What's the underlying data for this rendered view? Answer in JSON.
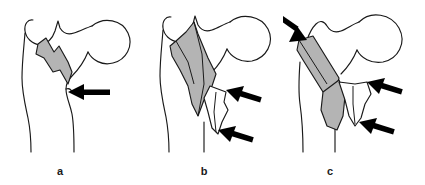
{
  "figure": {
    "background_color": "#ffffff",
    "outline_color": "#1a1a1a",
    "fragment_fill_color": "#b4b4b4",
    "arrow_color": "#000000",
    "width": 425,
    "height": 185
  },
  "panels": [
    {
      "id": "a",
      "label": "a",
      "caption": "a",
      "bone_part": "proximal-femur",
      "shaded_fragments": 1,
      "arrows": 1,
      "arrow_directions": [
        "left"
      ]
    },
    {
      "id": "b",
      "label": "b",
      "caption": "b",
      "bone_part": "proximal-femur",
      "shaded_fragments": 2,
      "arrows": 2,
      "arrow_directions": [
        "up-left",
        "up-left"
      ]
    },
    {
      "id": "c",
      "label": "c",
      "caption": "c",
      "bone_part": "proximal-femur",
      "shaded_fragments": 2,
      "arrows": 3,
      "arrow_directions": [
        "down-right",
        "down-left",
        "up-left"
      ]
    }
  ]
}
